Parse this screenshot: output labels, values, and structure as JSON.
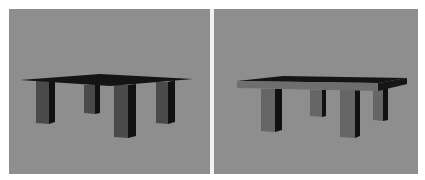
{
  "figure": {
    "panels": [
      {
        "id": "left",
        "subject": "3D rendered table, four legs, thin dark tabletop",
        "colors": {
          "background": "#8e8e8e",
          "tabletop": "#141414",
          "leg_front": "#4a4a4a",
          "leg_side": "#111111"
        }
      },
      {
        "id": "right",
        "subject": "3D rendered table, four legs, tabletop with visible front edge",
        "colors": {
          "background": "#8e8e8e",
          "tabletop": "#141414",
          "tabletop_edge": "#6e6e6e",
          "leg_front": "#666666",
          "leg_side": "#111111"
        }
      }
    ],
    "divider_color": "#f2f2f2"
  }
}
